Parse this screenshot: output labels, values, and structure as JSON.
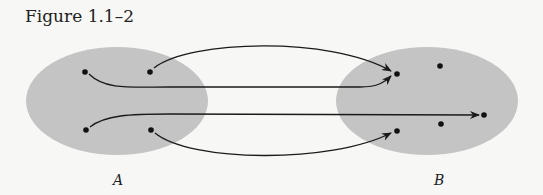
{
  "figure": {
    "caption": "Figure 1.1–2",
    "colors": {
      "set_fill": "#c4c4c4",
      "stroke": "#1a1a1a",
      "background": "#f7f7f5"
    },
    "sets": [
      {
        "label": "A",
        "points": [
          [
            85,
            72
          ],
          [
            150,
            72
          ],
          [
            86,
            130
          ],
          [
            151,
            130
          ]
        ]
      },
      {
        "label": "B",
        "points": [
          [
            397,
            74
          ],
          [
            440,
            66
          ],
          [
            484,
            115
          ],
          [
            441,
            124
          ],
          [
            397,
            131
          ]
        ]
      }
    ],
    "mappings": [
      {
        "from": "A.point1 (top-right)",
        "to": "B.point1 (top-left)"
      },
      {
        "from": "A.point0 (top-left)",
        "to": "B.point1 (top-left)"
      },
      {
        "from": "A.point2 (bottom-left)",
        "to": "B.point2 (right)"
      },
      {
        "from": "A.point3 (bottom-right)",
        "to": "B.point4 (bottom-left)"
      }
    ]
  }
}
